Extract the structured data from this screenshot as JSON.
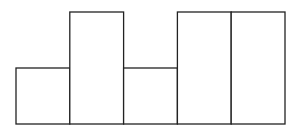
{
  "chart_data": {
    "type": "bar",
    "title": "",
    "xlabel": "",
    "ylabel": "",
    "categories": [
      "1",
      "2",
      "3",
      "4",
      "5"
    ],
    "values": [
      1,
      2,
      1,
      2,
      2
    ],
    "ylim": [
      0,
      2
    ],
    "grid": false,
    "legend": null,
    "bar_fill": "#ffffff",
    "bar_stroke": "#222222"
  },
  "layout": {
    "x0": 16,
    "bar_width": 53.8,
    "baseline_y": 124,
    "unit_height": 56
  }
}
